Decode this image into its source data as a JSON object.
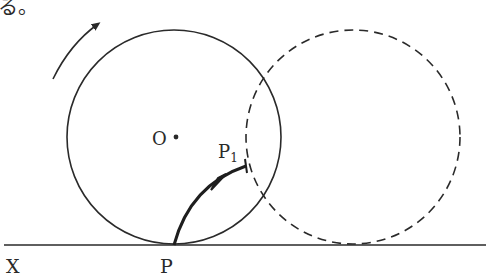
{
  "header_fragment": "る。",
  "labels": {
    "center": "O",
    "start_point": "P",
    "end_point_base": "P",
    "end_point_sub": "1",
    "line_label": "X"
  },
  "colors": {
    "ink": "#2a2a2a",
    "background": "#ffffff"
  },
  "figure": {
    "rolling_circle": {
      "style": "solid",
      "center": [
        174,
        137
      ],
      "radius": 107
    },
    "moved_circle": {
      "style": "dashed",
      "center": [
        353,
        137
      ],
      "radius": 107
    },
    "ground_line_y": 245,
    "rotation_direction": "clockwise"
  }
}
